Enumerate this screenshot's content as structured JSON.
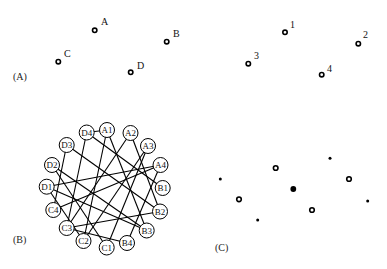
{
  "panels": {
    "A": {
      "label": "(A)",
      "label_pos": [
        13,
        80
      ],
      "points": [
        {
          "name": "A",
          "x": 94.7,
          "y": 30.3,
          "lx": 101,
          "ly": 25
        },
        {
          "name": "B",
          "x": 166.7,
          "y": 41.7,
          "lx": 173,
          "ly": 37
        },
        {
          "name": "C",
          "x": 58.3,
          "y": 61.7,
          "lx": 64,
          "ly": 57
        },
        {
          "name": "D",
          "x": 130.7,
          "y": 72.3,
          "lx": 137,
          "ly": 69
        }
      ]
    },
    "numbered": {
      "points": [
        {
          "name": "1",
          "x": 285,
          "y": 32.3,
          "lx": 290,
          "ly": 28
        },
        {
          "name": "2",
          "x": 358.3,
          "y": 43.7,
          "lx": 363,
          "ly": 38
        },
        {
          "name": "3",
          "x": 248.3,
          "y": 63.7,
          "lx": 254,
          "ly": 59
        },
        {
          "name": "4",
          "x": 321.7,
          "y": 74.7,
          "lx": 327,
          "ly": 72
        }
      ]
    },
    "B": {
      "label": "(B)",
      "label_pos": [
        13,
        243
      ],
      "node_radius": 7.5,
      "nodes": [
        {
          "name": "D4",
          "x": 86.7,
          "y": 132.5
        },
        {
          "name": "A1",
          "x": 107,
          "y": 130
        },
        {
          "name": "A2",
          "x": 130.5,
          "y": 133
        },
        {
          "name": "A3",
          "x": 148,
          "y": 146
        },
        {
          "name": "A4",
          "x": 160.5,
          "y": 165
        },
        {
          "name": "B1",
          "x": 162.7,
          "y": 188
        },
        {
          "name": "B2",
          "x": 160,
          "y": 211.5
        },
        {
          "name": "B3",
          "x": 146.7,
          "y": 230.5
        },
        {
          "name": "B4",
          "x": 127,
          "y": 243
        },
        {
          "name": "C1",
          "x": 106.7,
          "y": 247.5
        },
        {
          "name": "C2",
          "x": 83.5,
          "y": 241
        },
        {
          "name": "C3",
          "x": 66.7,
          "y": 228
        },
        {
          "name": "C4",
          "x": 53.3,
          "y": 210
        },
        {
          "name": "D1",
          "x": 46.7,
          "y": 186.7
        },
        {
          "name": "D2",
          "x": 52,
          "y": 165
        },
        {
          "name": "D3",
          "x": 66.7,
          "y": 145
        }
      ],
      "edges": [
        [
          "D4",
          "A1"
        ],
        [
          "D4",
          "C3"
        ],
        [
          "D4",
          "B1"
        ],
        [
          "A1",
          "C2"
        ],
        [
          "A1",
          "B3"
        ],
        [
          "A2",
          "C3"
        ],
        [
          "A2",
          "B2"
        ],
        [
          "A3",
          "C1"
        ],
        [
          "A3",
          "C2"
        ],
        [
          "A4",
          "D1"
        ],
        [
          "A4",
          "B4"
        ],
        [
          "D3",
          "B2"
        ],
        [
          "D3",
          "C4"
        ],
        [
          "D2",
          "C1"
        ],
        [
          "D2",
          "B3"
        ],
        [
          "D1",
          "B3"
        ],
        [
          "D1",
          "C2"
        ],
        [
          "C3",
          "B2"
        ],
        [
          "C4",
          "A4"
        ],
        [
          "B4",
          "C3"
        ]
      ]
    },
    "C": {
      "label": "(C)",
      "label_pos": [
        215,
        251
      ],
      "points": [
        {
          "type": "dot",
          "x": 220.3,
          "y": 179
        },
        {
          "type": "ring",
          "x": 275.7,
          "y": 168
        },
        {
          "type": "dot",
          "x": 330,
          "y": 158.3
        },
        {
          "type": "ring",
          "x": 349,
          "y": 179
        },
        {
          "type": "bigdot",
          "x": 293.3,
          "y": 189
        },
        {
          "type": "ring",
          "x": 239,
          "y": 199.3
        },
        {
          "type": "dot",
          "x": 367.7,
          "y": 201
        },
        {
          "type": "ring",
          "x": 312,
          "y": 210
        },
        {
          "type": "dot",
          "x": 257.7,
          "y": 220
        }
      ]
    }
  }
}
